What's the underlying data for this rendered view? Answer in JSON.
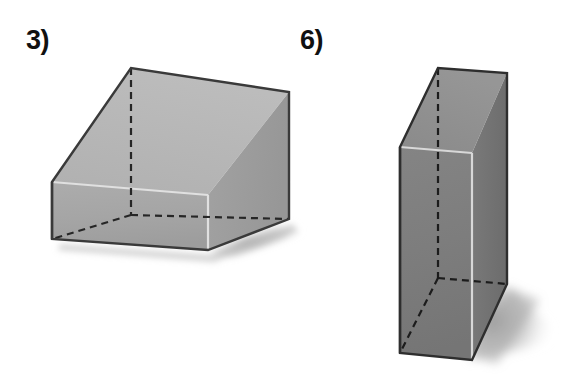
{
  "page": {
    "background_color": "#ffffff",
    "width": 571,
    "height": 388,
    "kind": "geometry-worksheet-figures"
  },
  "figures": [
    {
      "id": "figure-3",
      "label": "3)",
      "shape_name": "rectangular prism",
      "description": "Wide short rectangular prism (box) drawn in 3-D with hidden edges dashed",
      "label_position": {
        "x": 26,
        "y": 27
      },
      "colors": {
        "front_face": "#a6a6a6",
        "side_face": "#9c9c9c",
        "top_face": "#b6b6b6",
        "outline": "#3a3a3a",
        "inner_edge": "#e0e0e0",
        "hidden_edge": "#262626",
        "shadow": "#b0b0b0"
      },
      "vertices": {
        "front_bottom_left": {
          "x": 52,
          "y": 239
        },
        "front_bottom_right": {
          "x": 208,
          "y": 250
        },
        "front_top_left": {
          "x": 52,
          "y": 182
        },
        "front_top_right": {
          "x": 208,
          "y": 195
        },
        "back_top_left": {
          "x": 131,
          "y": 68
        },
        "back_top_right": {
          "x": 289,
          "y": 92
        },
        "back_bottom_right": {
          "x": 289,
          "y": 219
        },
        "hidden_back_bottom_left": {
          "x": 131,
          "y": 215
        }
      },
      "edges": {
        "solid_count": 9,
        "dashed_count": 3,
        "dash_pattern": "7 5"
      }
    },
    {
      "id": "figure-6",
      "label": "6)",
      "shape_name": "rectangular prism",
      "description": "Tall narrow rectangular prism (box) drawn in 3-D with hidden edges dashed",
      "label_position": {
        "x": 300,
        "y": 27
      },
      "colors": {
        "front_face": "#7e7e7e",
        "side_face": "#767676",
        "top_face": "#8e8e8e",
        "outline": "#2e2e2e",
        "inner_edge": "#d8d8d8",
        "hidden_edge": "#1c1c1c",
        "shadow": "#a9a9a9"
      },
      "vertices": {
        "front_bottom_left": {
          "x": 400,
          "y": 353
        },
        "front_bottom_right": {
          "x": 472,
          "y": 360
        },
        "front_top_left": {
          "x": 400,
          "y": 147
        },
        "front_top_right": {
          "x": 472,
          "y": 153
        },
        "back_top_left": {
          "x": 438,
          "y": 68
        },
        "back_top_right": {
          "x": 507,
          "y": 73
        },
        "back_bottom_right": {
          "x": 507,
          "y": 284
        },
        "hidden_back_bottom_left": {
          "x": 438,
          "y": 278
        }
      },
      "edges": {
        "solid_count": 9,
        "dashed_count": 3,
        "dash_pattern": "7 5"
      }
    }
  ]
}
